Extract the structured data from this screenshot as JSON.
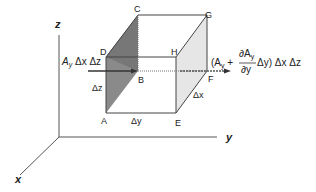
{
  "diagram": {
    "axes": {
      "z": "z",
      "y": "y",
      "x": "x"
    },
    "vertices": {
      "A": "A",
      "B": "B",
      "C": "C",
      "D": "D",
      "E": "E",
      "F": "F",
      "G": "G",
      "H": "H"
    },
    "dimensions": {
      "dz": "Δz",
      "dy": "Δy",
      "dx": "Δx"
    },
    "inflow": {
      "A": "A",
      "sub": "y",
      "rest": " Δx Δz"
    },
    "outflow": {
      "open": "(A",
      "sub": "y",
      "plus": " +",
      "num_d": "∂A",
      "num_sub": "y",
      "den": "∂y",
      "after": "Δy) Δx Δz"
    },
    "colors": {
      "left_face": "#8a8a8a",
      "right_face": "#e6e6e6",
      "line": "#444444"
    }
  }
}
